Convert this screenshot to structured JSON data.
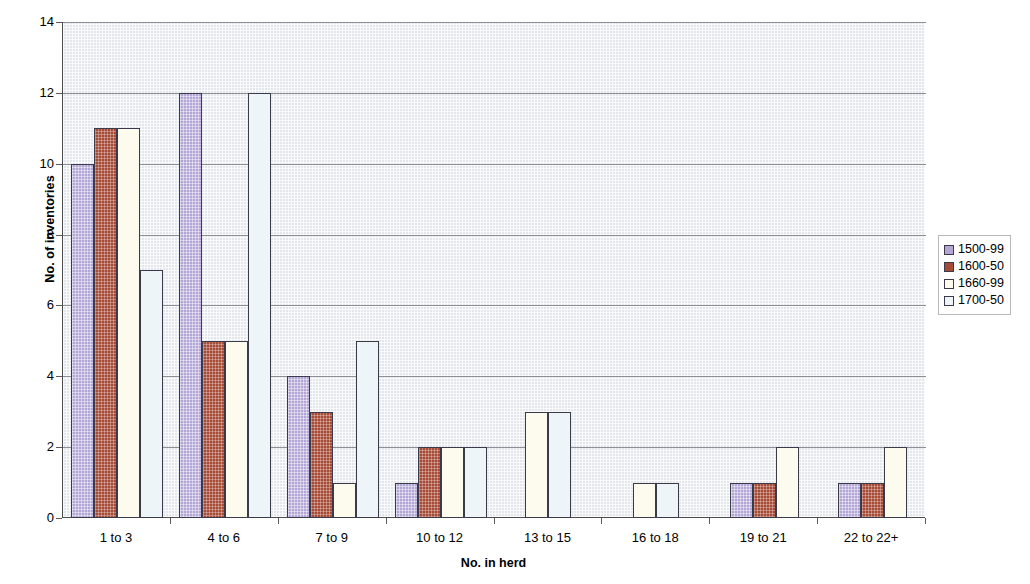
{
  "chart_data": {
    "type": "bar",
    "title": "",
    "xlabel": "No. in herd",
    "ylabel": "No. of inventories",
    "categories": [
      "1 to 3",
      "4 to 6",
      "7 to 9",
      "10 to 12",
      "13 to 15",
      "16 to 18",
      "19 to 21",
      "22 to 22+"
    ],
    "series": [
      {
        "name": "1500-99",
        "color": "#b3a6d6",
        "values": [
          10,
          12,
          4,
          1,
          0,
          0,
          1,
          1
        ]
      },
      {
        "name": "1600-50",
        "color": "#a64b36",
        "values": [
          11,
          5,
          3,
          2,
          0,
          0,
          1,
          1
        ]
      },
      {
        "name": "1660-99",
        "color": "#fdfbee",
        "values": [
          11,
          5,
          1,
          2,
          3,
          1,
          2,
          2
        ]
      },
      {
        "name": "1700-50",
        "color": "#eef5f8",
        "values": [
          7,
          12,
          5,
          2,
          3,
          1,
          0,
          0
        ]
      }
    ],
    "ylim": [
      0,
      14
    ],
    "y_ticks": [
      0,
      2,
      4,
      6,
      8,
      10,
      12,
      14
    ],
    "y_tick_labels": [
      "0",
      "2",
      "4",
      "6",
      "8",
      "10",
      "12",
      "14"
    ],
    "grid": true,
    "legend_position": "right",
    "plot_background": "#e3e7ec"
  }
}
